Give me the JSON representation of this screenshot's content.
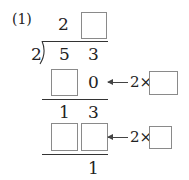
{
  "problem": {
    "label": "(1)",
    "divisor": "2",
    "dividend": [
      "5",
      "3"
    ],
    "quotient": {
      "tens": "2",
      "ones": ""
    },
    "steps": [
      {
        "row": "product-1",
        "digits": [
          "",
          "0"
        ],
        "hint": {
          "prefix": "2×",
          "blank": ""
        }
      },
      {
        "row": "remainder-1",
        "digits": [
          "1",
          "3"
        ]
      },
      {
        "row": "product-2",
        "digits": [
          "",
          ""
        ],
        "hint": {
          "prefix": "2×",
          "blank": ""
        }
      },
      {
        "row": "final-remainder",
        "digits": [
          "",
          "1"
        ]
      }
    ]
  },
  "colors": {
    "text": "#222222",
    "box_border": "#8a8a8a",
    "line": "#333333"
  }
}
